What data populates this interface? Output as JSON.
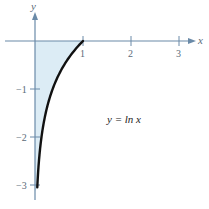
{
  "chart_data": {
    "type": "line",
    "title": "",
    "function_label": "y = ln x",
    "xlabel": "x",
    "ylabel": "y",
    "xlim": [
      -0.7,
      3.6
    ],
    "ylim": [
      -3.4,
      0.85
    ],
    "x_ticks": [
      1,
      2,
      3
    ],
    "x_tick_labels": [
      "1",
      "2",
      "3"
    ],
    "y_ticks": [
      -1,
      -2,
      -3
    ],
    "y_tick_labels": [
      "−1",
      "−2",
      "−3"
    ],
    "grid": false,
    "legend": null,
    "series": [
      {
        "name": "y = ln x",
        "x": [
          0.0498,
          0.06,
          0.08,
          0.1,
          0.135,
          0.18,
          0.25,
          0.33,
          0.45,
          0.6,
          0.75,
          0.9,
          1.0
        ],
        "values": [
          -3.0,
          -2.81,
          -2.53,
          -2.3,
          -2.0,
          -1.71,
          -1.39,
          -1.11,
          -0.8,
          -0.51,
          -0.29,
          -0.11,
          0.0
        ]
      }
    ],
    "shaded_region": {
      "description": "Region between y-axis, x-axis and the curve y = ln x for 0 < x <= 1",
      "x_from": 0,
      "x_to": 1,
      "y_from": -3,
      "y_to": 0
    }
  },
  "colors": {
    "axis": "#6a8aa8",
    "curve": "#111111",
    "fill": "#dcecf5",
    "text": "#5a6a78"
  },
  "labels": {
    "x_axis": "x",
    "y_axis": "y",
    "function": "y = ln x",
    "x_tick_1": "1",
    "x_tick_2": "2",
    "x_tick_3": "3",
    "y_tick_m1": "−1",
    "y_tick_m2": "−2",
    "y_tick_m3": "−3"
  }
}
